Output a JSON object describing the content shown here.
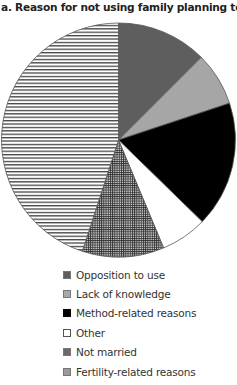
{
  "chart_data": {
    "type": "pie",
    "title": "a. Reason for not using family planning to limit births",
    "categories": [
      "Opposition to use",
      "Lack of knowledge",
      "Method-related reasons",
      "Other",
      "Not married",
      "Fertility-related reasons"
    ],
    "values": [
      12.5,
      7.4,
      17.4,
      6.4,
      11.3,
      45.0
    ],
    "unit": "percent (estimated from slice angles)",
    "start_angle_deg": 0,
    "direction": "clockwise",
    "fills": [
      "#5e5e5e",
      "#a6a6a6",
      "#000000",
      "#ffffff",
      "crosshatch",
      "horizontal-stripes"
    ],
    "legend_position": "bottom",
    "legend": [
      {
        "label": "Opposition to use",
        "swatch": "#5e5e5e"
      },
      {
        "label": "Lack of knowledge",
        "swatch": "#a8a8a8"
      },
      {
        "label": "Method-related reasons",
        "swatch": "#000000"
      },
      {
        "label": "Other",
        "swatch": "#ffffff"
      },
      {
        "label": "Not married",
        "swatch": "#6a6a6a"
      },
      {
        "label": "Fertility-related reasons",
        "swatch": "#9a9a9a"
      }
    ]
  }
}
